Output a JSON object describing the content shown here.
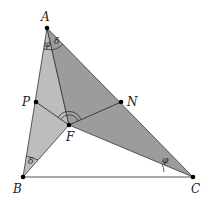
{
  "diagram": {
    "points": {
      "A": {
        "label": "A",
        "x": 47,
        "y": 28
      },
      "B": {
        "label": "B",
        "x": 23,
        "y": 177
      },
      "C": {
        "label": "C",
        "x": 193,
        "y": 177
      },
      "F": {
        "label": "F",
        "x": 69,
        "y": 125
      },
      "P": {
        "label": "P",
        "x": 36,
        "y": 102
      },
      "N": {
        "label": "N",
        "x": 121,
        "y": 102
      }
    },
    "angle_labels": {
      "A_left": "φ",
      "A_right": "δ",
      "B": "δ",
      "C": "φ"
    },
    "colors": {
      "region_ABF": "#bdbdbd",
      "region_AFC": "#9c9c9c",
      "stroke": "#333333",
      "baseline": "#555555"
    }
  }
}
